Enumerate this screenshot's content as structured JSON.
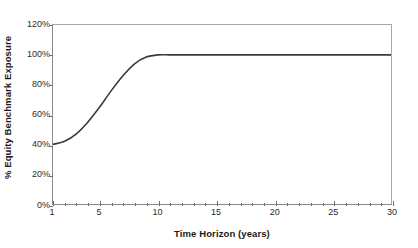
{
  "chart_data": {
    "type": "line",
    "title": "",
    "xlabel": "Time Horizon (years)",
    "ylabel": "% Equity Benchmark Exposure",
    "xlim": [
      1,
      30
    ],
    "ylim": [
      0,
      120
    ],
    "grid": false,
    "legend": null,
    "x_tick_labels": [
      "1",
      "5",
      "10",
      "15",
      "20",
      "25",
      "30"
    ],
    "x_tick_values": [
      1,
      5,
      10,
      15,
      20,
      25,
      30
    ],
    "x_minor_ticks_every": 1,
    "y_tick_labels": [
      "0%",
      "20%",
      "40%",
      "60%",
      "80%",
      "100%",
      "120%"
    ],
    "y_tick_values": [
      0,
      20,
      40,
      60,
      80,
      100,
      120
    ],
    "line_color": "#3a3a3a",
    "frame_color": "#8a8a8a",
    "series": [
      {
        "name": "Equity benchmark exposure glide path",
        "x": [
          1,
          2,
          3,
          4,
          5,
          6,
          7,
          8,
          9,
          10,
          11,
          12,
          13,
          14,
          15,
          16,
          17,
          18,
          19,
          20,
          21,
          22,
          23,
          24,
          25,
          26,
          27,
          28,
          29,
          30
        ],
        "values": [
          40,
          42,
          47,
          55,
          65,
          76,
          86,
          94,
          98.5,
          100,
          100,
          100,
          100,
          100,
          100,
          100,
          100,
          100,
          100,
          100,
          100,
          100,
          100,
          100,
          100,
          100,
          100,
          100,
          100,
          100
        ]
      }
    ]
  }
}
